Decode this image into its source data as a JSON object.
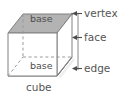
{
  "figure": {
    "title_caption": "cube",
    "shape_name": "cube",
    "projection": "oblique",
    "colors": {
      "face_fill_gray": "#b3b3b3",
      "front_face_fill": "#ffffff",
      "outline": "#808080",
      "hidden_edge": "#9a9a9a",
      "text": "#555555",
      "background": "#ffffff",
      "highlight_edge": "#f2f2f2"
    },
    "face_labels": [
      {
        "name": "base-top",
        "text": "base"
      },
      {
        "name": "base-bottom",
        "text": "base"
      }
    ],
    "callouts": [
      {
        "name": "vertex",
        "text": "vertex",
        "arrow": "left-pointing",
        "target": "top-right corner point"
      },
      {
        "name": "face",
        "text": "face",
        "arrow": "left-pointing",
        "target": "right side face"
      },
      {
        "name": "edge",
        "text": "edge",
        "arrow": "left-pointing",
        "target": "bottom-right edge"
      }
    ],
    "caption": "cube"
  }
}
